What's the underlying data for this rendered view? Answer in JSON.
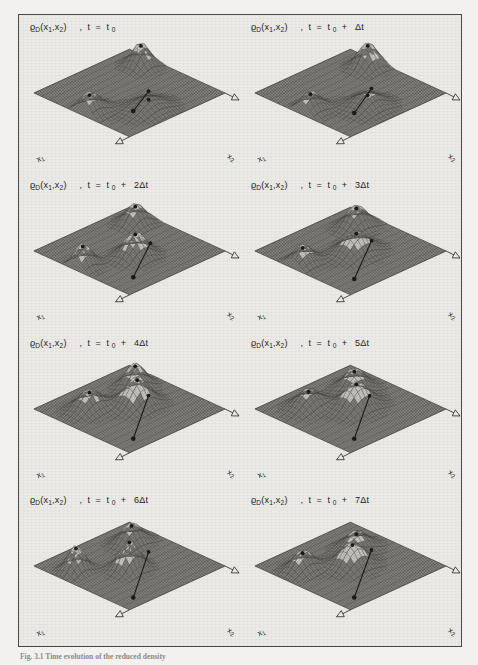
{
  "figure": {
    "caption": "Fig. 3.1  Time evolution of the reduced density",
    "background_color": "#f2f1ef",
    "frame_color": "#4a4a48",
    "panel_bg_color": "#eceae6",
    "mesh_color": "#555552",
    "surface_fill": "#8e8d89",
    "marker_color": "#1a1a1a"
  },
  "axes": {
    "x1_label": "x",
    "x1_sub": "1",
    "x2_label": "x",
    "x2_sub": "2"
  },
  "density_symbol": {
    "rho": "ϱ",
    "sub": "D",
    "args": "(x",
    "arg1_sub": "1",
    "comma": ",x",
    "arg2_sub": "2",
    "close": ")"
  },
  "panels": [
    {
      "index": 0,
      "time_expr": "t = t",
      "t_sub": "0",
      "offset": "",
      "offset_unit": "",
      "title_plain": "ϱD(x1,x2) , t = t0"
    },
    {
      "index": 1,
      "time_expr": "t = t",
      "t_sub": "0",
      "offset": "",
      "offset_unit": "Δt",
      "title_plain": "ϱD(x1,x2) , t = t0 + Δt"
    },
    {
      "index": 2,
      "time_expr": "t = t",
      "t_sub": "0",
      "offset": "2",
      "offset_unit": "Δt",
      "title_plain": "ϱD(x1,x2) , t = t0 + 2Δt"
    },
    {
      "index": 3,
      "time_expr": "t = t",
      "t_sub": "0",
      "offset": "3",
      "offset_unit": "Δt",
      "title_plain": "ϱD(x1,x2) , t = t0 + 3Δt"
    },
    {
      "index": 4,
      "time_expr": "t = t",
      "t_sub": "0",
      "offset": "4",
      "offset_unit": "Δt",
      "title_plain": "ϱD(x1,x2) , t = t0 + 4Δt"
    },
    {
      "index": 5,
      "time_expr": "t = t",
      "t_sub": "0",
      "offset": "5",
      "offset_unit": "Δt",
      "title_plain": "ϱD(x1,x2) , t = t0 + 5Δt"
    },
    {
      "index": 6,
      "time_expr": "t = t",
      "t_sub": "0",
      "offset": "6",
      "offset_unit": "Δt",
      "title_plain": "ϱD(x1,x2) , t = t0 + 6Δt"
    },
    {
      "index": 7,
      "time_expr": "t = t",
      "t_sub": "0",
      "offset": "7",
      "offset_unit": "Δt",
      "title_plain": "ϱD(x1,x2) , t = t0 + 7Δt"
    }
  ],
  "chart_data": {
    "type": "surface",
    "xlabel": "x₁",
    "ylabel": "x₂",
    "zlabel": "ϱ_D",
    "projection": "isometric",
    "grid": true,
    "legend": "none",
    "n_frames": 8,
    "frame_times": [
      "t₀",
      "t₀+Δt",
      "t₀+2Δt",
      "t₀+3Δt",
      "t₀+4Δt",
      "t₀+5Δt",
      "t₀+6Δt",
      "t₀+7Δt"
    ],
    "frames": [
      {
        "t": "t₀",
        "peaks": [
          {
            "name": "left-corner-lobe",
            "u": 0.06,
            "v": 0.52,
            "height": 0.46,
            "sigma_u": 0.1,
            "sigma_v": 0.07
          },
          {
            "name": "right-corner-lobe",
            "u": 0.86,
            "v": 0.26,
            "height": 0.52,
            "sigma_u": 0.07,
            "sigma_v": 0.07
          },
          {
            "name": "central-lobe",
            "u": 0.4,
            "v": 0.8,
            "height": 0.3,
            "sigma_u": 0.12,
            "sigma_v": 0.1
          }
        ],
        "trajectory": {
          "x0": 0.3,
          "y0": 0.74,
          "x1": 0.62,
          "y1": 0.58,
          "dots": [
            0.16,
            0.88
          ]
        }
      },
      {
        "t": "t₀+Δt",
        "peaks": [
          {
            "name": "left-corner-lobe",
            "u": 0.08,
            "v": 0.5,
            "height": 0.44,
            "sigma_u": 0.09,
            "sigma_v": 0.07
          },
          {
            "name": "right-corner-lobe",
            "u": 0.88,
            "v": 0.3,
            "height": 0.54,
            "sigma_u": 0.08,
            "sigma_v": 0.07
          },
          {
            "name": "central-lobe",
            "u": 0.42,
            "v": 0.76,
            "height": 0.34,
            "sigma_u": 0.11,
            "sigma_v": 0.1
          }
        ],
        "trajectory": {
          "x0": 0.28,
          "y0": 0.76,
          "x1": 0.66,
          "y1": 0.56,
          "dots": [
            0.14,
            0.86
          ]
        }
      },
      {
        "t": "t₀+2Δt",
        "peaks": [
          {
            "name": "left-corner-lobe",
            "u": 0.07,
            "v": 0.44,
            "height": 0.52,
            "sigma_u": 0.08,
            "sigma_v": 0.06
          },
          {
            "name": "right-corner-lobe",
            "u": 0.84,
            "v": 0.22,
            "height": 0.44,
            "sigma_u": 0.08,
            "sigma_v": 0.07
          },
          {
            "name": "central-lobe",
            "u": 0.46,
            "v": 0.6,
            "height": 0.56,
            "sigma_u": 0.09,
            "sigma_v": 0.08
          }
        ],
        "trajectory": {
          "x0": 0.22,
          "y0": 0.82,
          "x1": 0.7,
          "y1": 0.52,
          "dots": [
            0.1,
            0.9
          ]
        }
      },
      {
        "t": "t₀+3Δt",
        "peaks": [
          {
            "name": "left-corner-lobe",
            "u": 0.1,
            "v": 0.4,
            "height": 0.42,
            "sigma_u": 0.09,
            "sigma_v": 0.07
          },
          {
            "name": "right-corner-lobe",
            "u": 0.8,
            "v": 0.26,
            "height": 0.48,
            "sigma_u": 0.09,
            "sigma_v": 0.07
          },
          {
            "name": "central-lobe",
            "u": 0.5,
            "v": 0.56,
            "height": 0.5,
            "sigma_u": 0.11,
            "sigma_v": 0.09
          }
        ],
        "trajectory": {
          "x0": 0.2,
          "y0": 0.84,
          "x1": 0.72,
          "y1": 0.5,
          "dots": [
            0.08,
            0.92
          ]
        }
      },
      {
        "t": "t₀+4Δt",
        "peaks": [
          {
            "name": "left-corner-lobe",
            "u": 0.28,
            "v": 0.3,
            "height": 0.44,
            "sigma_u": 0.1,
            "sigma_v": 0.08
          },
          {
            "name": "right-corner-lobe",
            "u": 0.78,
            "v": 0.28,
            "height": 0.52,
            "sigma_u": 0.08,
            "sigma_v": 0.07
          },
          {
            "name": "central-lobe",
            "u": 0.58,
            "v": 0.5,
            "height": 0.62,
            "sigma_u": 0.1,
            "sigma_v": 0.09
          }
        ],
        "trajectory": {
          "x0": 0.18,
          "y0": 0.86,
          "x1": 0.74,
          "y1": 0.46,
          "dots": [
            0.07,
            0.93
          ]
        }
      },
      {
        "t": "t₀+5Δt",
        "peaks": [
          {
            "name": "left-corner-lobe",
            "u": 0.3,
            "v": 0.26,
            "height": 0.4,
            "sigma_u": 0.1,
            "sigma_v": 0.08
          },
          {
            "name": "right-corner-lobe",
            "u": 0.74,
            "v": 0.3,
            "height": 0.46,
            "sigma_u": 0.09,
            "sigma_v": 0.08
          },
          {
            "name": "central-lobe",
            "u": 0.54,
            "v": 0.52,
            "height": 0.58,
            "sigma_u": 0.11,
            "sigma_v": 0.09
          }
        ],
        "trajectory": {
          "x0": 0.18,
          "y0": 0.86,
          "x1": 0.74,
          "y1": 0.46,
          "dots": [
            0.07,
            0.93
          ]
        }
      },
      {
        "t": "t₀+6Δt",
        "peaks": [
          {
            "name": "left-corner-lobe",
            "u": 0.16,
            "v": 0.28,
            "height": 0.56,
            "sigma_u": 0.07,
            "sigma_v": 0.06
          },
          {
            "name": "right-corner-lobe",
            "u": 0.76,
            "v": 0.26,
            "height": 0.46,
            "sigma_u": 0.09,
            "sigma_v": 0.07
          },
          {
            "name": "central-lobe",
            "u": 0.46,
            "v": 0.54,
            "height": 0.66,
            "sigma_u": 0.08,
            "sigma_v": 0.07
          }
        ],
        "trajectory": {
          "x0": 0.16,
          "y0": 0.88,
          "x1": 0.76,
          "y1": 0.44,
          "dots": [
            0.06,
            0.94
          ]
        }
      },
      {
        "t": "t₀+7Δt",
        "peaks": [
          {
            "name": "left-corner-lobe",
            "u": 0.2,
            "v": 0.3,
            "height": 0.44,
            "sigma_u": 0.09,
            "sigma_v": 0.07
          },
          {
            "name": "right-corner-lobe",
            "u": 0.72,
            "v": 0.34,
            "height": 0.4,
            "sigma_u": 0.1,
            "sigma_v": 0.08
          },
          {
            "name": "central-lobe",
            "u": 0.5,
            "v": 0.52,
            "height": 0.54,
            "sigma_u": 0.1,
            "sigma_v": 0.09
          }
        ],
        "trajectory": {
          "x0": 0.16,
          "y0": 0.88,
          "x1": 0.78,
          "y1": 0.44,
          "dots": [
            0.06,
            0.94
          ]
        }
      }
    ]
  }
}
